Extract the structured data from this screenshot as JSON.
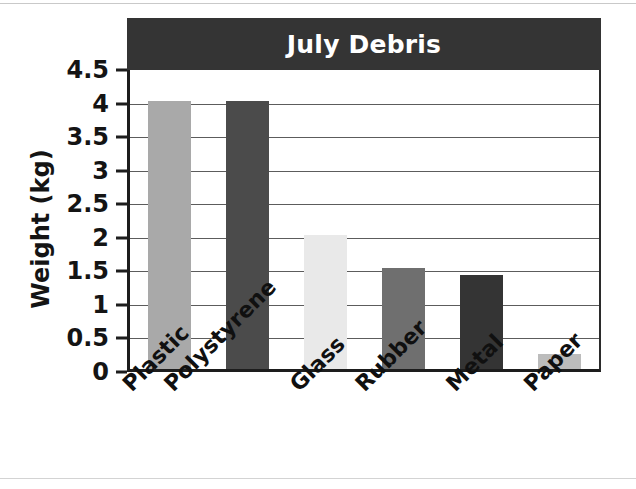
{
  "chart_data": {
    "type": "bar",
    "title": "July Debris",
    "xlabel": "",
    "ylabel": "Weight (kg)",
    "categories": [
      "Plastic",
      "Polystyrene",
      "Glass",
      "Rubber",
      "Metal",
      "Paper"
    ],
    "values": [
      4,
      4,
      2,
      1.5,
      1.4,
      0.22
    ],
    "bar_colors": [
      "#a9a9a9",
      "#4b4b4b",
      "#e9e9e9",
      "#6f6f6f",
      "#343434",
      "#bcbcbc"
    ],
    "ylim": [
      0,
      4.5
    ],
    "ytick_labels": [
      "4.5",
      "4",
      "3.5",
      "3",
      "2.5",
      "2",
      "1.5",
      "1",
      "0.5",
      "0"
    ],
    "ytick_values": [
      4.5,
      4,
      3.5,
      3,
      2.5,
      2,
      1.5,
      1,
      0.5,
      0
    ],
    "grid": true,
    "legend": "none"
  },
  "style": {
    "title_banner_color": "#343434",
    "title_text_color": "#ffffff",
    "axis_color": "#1d1d1d",
    "gridline_color": "#5c5c5c",
    "background": "#ffffff"
  }
}
